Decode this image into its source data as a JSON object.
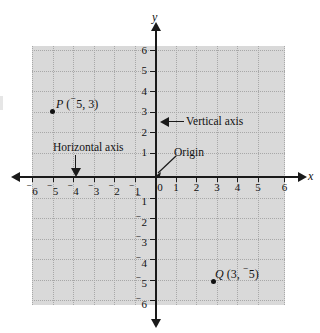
{
  "diagram": {
    "axis_labels": {
      "x": "x",
      "y": "y"
    },
    "x_ticks": [
      {
        "value": -6,
        "label": "6",
        "negative": true
      },
      {
        "value": -5,
        "label": "5",
        "negative": true
      },
      {
        "value": -4,
        "label": "4",
        "negative": true
      },
      {
        "value": -3,
        "label": "3",
        "negative": true
      },
      {
        "value": -2,
        "label": "2",
        "negative": true
      },
      {
        "value": -1,
        "label": "1",
        "negative": true
      },
      {
        "value": 0,
        "label": "0",
        "negative": false
      },
      {
        "value": 1,
        "label": "1",
        "negative": false
      },
      {
        "value": 2,
        "label": "2",
        "negative": false
      },
      {
        "value": 3,
        "label": "3",
        "negative": false
      },
      {
        "value": 4,
        "label": "4",
        "negative": false
      },
      {
        "value": 5,
        "label": "5",
        "negative": false
      },
      {
        "value": 6,
        "label": "6",
        "negative": false
      }
    ],
    "y_ticks": [
      {
        "value": 6,
        "label": "6",
        "negative": false
      },
      {
        "value": 5,
        "label": "5",
        "negative": false
      },
      {
        "value": 4,
        "label": "4",
        "negative": false
      },
      {
        "value": 3,
        "label": "3",
        "negative": false
      },
      {
        "value": 2,
        "label": "2",
        "negative": false
      },
      {
        "value": 1,
        "label": "1",
        "negative": false
      },
      {
        "value": -1,
        "label": "1",
        "negative": true
      },
      {
        "value": -2,
        "label": "2",
        "negative": true
      },
      {
        "value": -3,
        "label": "3",
        "negative": true
      },
      {
        "value": -4,
        "label": "4",
        "negative": true
      },
      {
        "value": -5,
        "label": "5",
        "negative": true
      },
      {
        "value": -6,
        "label": "6",
        "negative": true
      }
    ],
    "points": [
      {
        "id": "P",
        "name": "P",
        "x": -5,
        "y": 3,
        "label_name": "P",
        "label_open": " (",
        "label_x_negative": true,
        "label_x": "5",
        "label_sep": ", ",
        "label_y_negative": false,
        "label_y": "3",
        "label_close": ")"
      },
      {
        "id": "Q",
        "name": "Q",
        "x": 3,
        "y": -5,
        "label_name": "Q",
        "label_open": " (",
        "label_x_negative": false,
        "label_x": "3",
        "label_sep": ", ",
        "label_y_negative": true,
        "label_y": "5",
        "label_close": ")"
      }
    ],
    "annotations": {
      "vertical_axis": "Vertical axis",
      "horizontal_axis": "Horizontal axis",
      "origin": "Origin"
    },
    "colors": {
      "panel_fill": "#d9d9d9",
      "grid": "#a8a8a8",
      "axis": "#1a1a1a",
      "text": "#111111",
      "background": "#ffffff"
    }
  }
}
